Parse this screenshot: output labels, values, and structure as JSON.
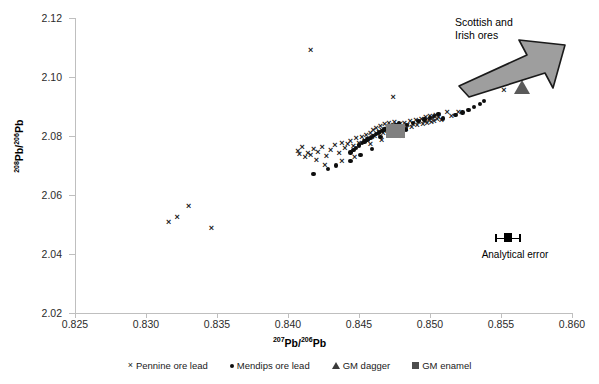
{
  "chart_data": {
    "type": "scatter",
    "title": "",
    "xlabel_parts": {
      "sup1": "207",
      "mid": "Pb/",
      "sup2": "206",
      "end": "Pb"
    },
    "ylabel_parts": {
      "sup1": "208",
      "mid": "Pb/",
      "sup2": "206",
      "end": "Pb"
    },
    "xlabel": "207Pb/206Pb",
    "ylabel": "208Pb/206Pb",
    "xlim": [
      0.825,
      0.86
    ],
    "ylim": [
      2.02,
      2.12
    ],
    "xticks": [
      "0.825",
      "0.830",
      "0.835",
      "0.840",
      "0.845",
      "0.850",
      "0.855",
      "0.860"
    ],
    "xtick_values": [
      0.825,
      0.83,
      0.835,
      0.84,
      0.845,
      0.85,
      0.855,
      0.86
    ],
    "yticks": [
      "2.02",
      "2.04",
      "2.06",
      "2.08",
      "2.10",
      "2.12"
    ],
    "ytick_values": [
      2.02,
      2.04,
      2.06,
      2.08,
      2.1,
      2.12
    ],
    "grid": false,
    "legend_position": "bottom",
    "series": [
      {
        "name": "Pennine ore lead",
        "marker": "x",
        "color": "#1a1a1a",
        "points": [
          [
            0.8316,
            2.0508
          ],
          [
            0.8322,
            2.0525
          ],
          [
            0.833,
            2.056
          ],
          [
            0.8346,
            2.0488
          ],
          [
            0.8416,
            2.109
          ],
          [
            0.8407,
            2.0748
          ],
          [
            0.8408,
            2.0737
          ],
          [
            0.841,
            2.076
          ],
          [
            0.8412,
            2.0726
          ],
          [
            0.8414,
            2.0742
          ],
          [
            0.8416,
            2.0733
          ],
          [
            0.8418,
            2.0755
          ],
          [
            0.842,
            2.0718
          ],
          [
            0.8421,
            2.0745
          ],
          [
            0.8424,
            2.0762
          ],
          [
            0.8427,
            2.073
          ],
          [
            0.843,
            2.0752
          ],
          [
            0.8433,
            2.0768
          ],
          [
            0.8436,
            2.074
          ],
          [
            0.8438,
            2.0775
          ],
          [
            0.844,
            2.0758
          ],
          [
            0.8442,
            2.0772
          ],
          [
            0.8444,
            2.0782
          ],
          [
            0.8446,
            2.0765
          ],
          [
            0.8448,
            2.079
          ],
          [
            0.845,
            2.0774
          ],
          [
            0.8452,
            2.0796
          ],
          [
            0.8454,
            2.078
          ],
          [
            0.8455,
            2.0802
          ],
          [
            0.8456,
            2.0788
          ],
          [
            0.8458,
            2.081
          ],
          [
            0.8459,
            2.0795
          ],
          [
            0.846,
            2.0818
          ],
          [
            0.8461,
            2.08
          ],
          [
            0.8462,
            2.0826
          ],
          [
            0.8463,
            2.0806
          ],
          [
            0.8464,
            2.0812
          ],
          [
            0.8465,
            2.0832
          ],
          [
            0.8466,
            2.0818
          ],
          [
            0.8467,
            2.0808
          ],
          [
            0.8468,
            2.0838
          ],
          [
            0.8469,
            2.0822
          ],
          [
            0.847,
            2.0814
          ],
          [
            0.8471,
            2.0842
          ],
          [
            0.8472,
            2.0828
          ],
          [
            0.8473,
            2.082
          ],
          [
            0.8474,
            2.0836
          ],
          [
            0.8475,
            2.0846
          ],
          [
            0.8476,
            2.0826
          ],
          [
            0.8477,
            2.0834
          ],
          [
            0.8478,
            2.0816
          ],
          [
            0.8479,
            2.084
          ],
          [
            0.848,
            2.083
          ],
          [
            0.8482,
            2.0844
          ],
          [
            0.8483,
            2.0822
          ],
          [
            0.8484,
            2.0836
          ],
          [
            0.8486,
            2.0848
          ],
          [
            0.8487,
            2.0828
          ],
          [
            0.8488,
            2.084
          ],
          [
            0.849,
            2.0852
          ],
          [
            0.8491,
            2.0834
          ],
          [
            0.8492,
            2.0846
          ],
          [
            0.8494,
            2.0856
          ],
          [
            0.8495,
            2.0838
          ],
          [
            0.8496,
            2.085
          ],
          [
            0.8497,
            2.0862
          ],
          [
            0.8498,
            2.0842
          ],
          [
            0.8499,
            2.0854
          ],
          [
            0.85,
            2.0866
          ],
          [
            0.8501,
            2.0846
          ],
          [
            0.8502,
            2.0858
          ],
          [
            0.8503,
            2.0848
          ],
          [
            0.8504,
            2.087
          ],
          [
            0.8505,
            2.0856
          ],
          [
            0.8506,
            2.0862
          ],
          [
            0.8508,
            2.0852
          ],
          [
            0.8474,
            2.093
          ],
          [
            0.8512,
            2.0878
          ],
          [
            0.8515,
            2.0866
          ],
          [
            0.852,
            2.088
          ],
          [
            0.8426,
            2.07
          ],
          [
            0.8438,
            2.0712
          ],
          [
            0.8447,
            2.0726
          ],
          [
            0.8458,
            2.077
          ],
          [
            0.8466,
            2.0784
          ],
          [
            0.848,
            2.08
          ],
          [
            0.8552,
            2.0955
          ]
        ]
      },
      {
        "name": "Mendips ore lead",
        "marker": "dot",
        "color": "#0d0d0d",
        "points": [
          [
            0.8418,
            2.0672
          ],
          [
            0.8428,
            2.0688
          ],
          [
            0.8434,
            2.07
          ],
          [
            0.8444,
            2.0744
          ],
          [
            0.8446,
            2.0752
          ],
          [
            0.8448,
            2.076
          ],
          [
            0.845,
            2.0768
          ],
          [
            0.8452,
            2.0776
          ],
          [
            0.8454,
            2.0782
          ],
          [
            0.8456,
            2.0788
          ],
          [
            0.8458,
            2.0794
          ],
          [
            0.846,
            2.08
          ],
          [
            0.8462,
            2.0806
          ],
          [
            0.8464,
            2.0812
          ],
          [
            0.8466,
            2.0818
          ],
          [
            0.8468,
            2.0822
          ],
          [
            0.847,
            2.0826
          ],
          [
            0.8472,
            2.083
          ],
          [
            0.8474,
            2.0834
          ],
          [
            0.8476,
            2.0838
          ],
          [
            0.8478,
            2.0842
          ],
          [
            0.848,
            2.0828
          ],
          [
            0.8484,
            2.0838
          ],
          [
            0.8488,
            2.0844
          ],
          [
            0.8492,
            2.085
          ],
          [
            0.8496,
            2.0856
          ],
          [
            0.85,
            2.0862
          ],
          [
            0.8503,
            2.0868
          ],
          [
            0.8506,
            2.0874
          ],
          [
            0.8509,
            2.086
          ],
          [
            0.8518,
            2.0872
          ],
          [
            0.8523,
            2.088
          ],
          [
            0.8527,
            2.0888
          ],
          [
            0.8531,
            2.0898
          ],
          [
            0.8535,
            2.0908
          ],
          [
            0.8538,
            2.0918
          ],
          [
            0.8444,
            2.0716
          ],
          [
            0.8451,
            2.0736
          ],
          [
            0.8459,
            2.0756
          ],
          [
            0.8465,
            2.0796
          ],
          [
            0.8471,
            2.081
          ],
          [
            0.8483,
            2.0822
          ]
        ]
      },
      {
        "name": "GM dagger",
        "marker": "triangle",
        "color": "#5a5a5a",
        "points": [
          [
            0.8565,
            2.0965
          ]
        ]
      },
      {
        "name": "GM enamel",
        "marker": "square",
        "color": "#808080",
        "points": [
          [
            0.8476,
            2.0818
          ]
        ]
      }
    ],
    "annotations": [
      {
        "name": "scottish-irish-ores",
        "text_line1": "Scottish and",
        "text_line2": "Irish ores"
      },
      {
        "name": "analytical-error",
        "text": "Analytical error",
        "x": 0.8551,
        "y": 2.0443
      }
    ]
  },
  "legend": {
    "items": [
      {
        "glyph": "×",
        "label": "Pennine ore lead"
      },
      {
        "glyph": "•",
        "label": "Mendips ore lead"
      },
      {
        "glyph": "▲",
        "label": "GM dagger"
      },
      {
        "glyph": "■",
        "label": "GM enamel"
      }
    ]
  }
}
